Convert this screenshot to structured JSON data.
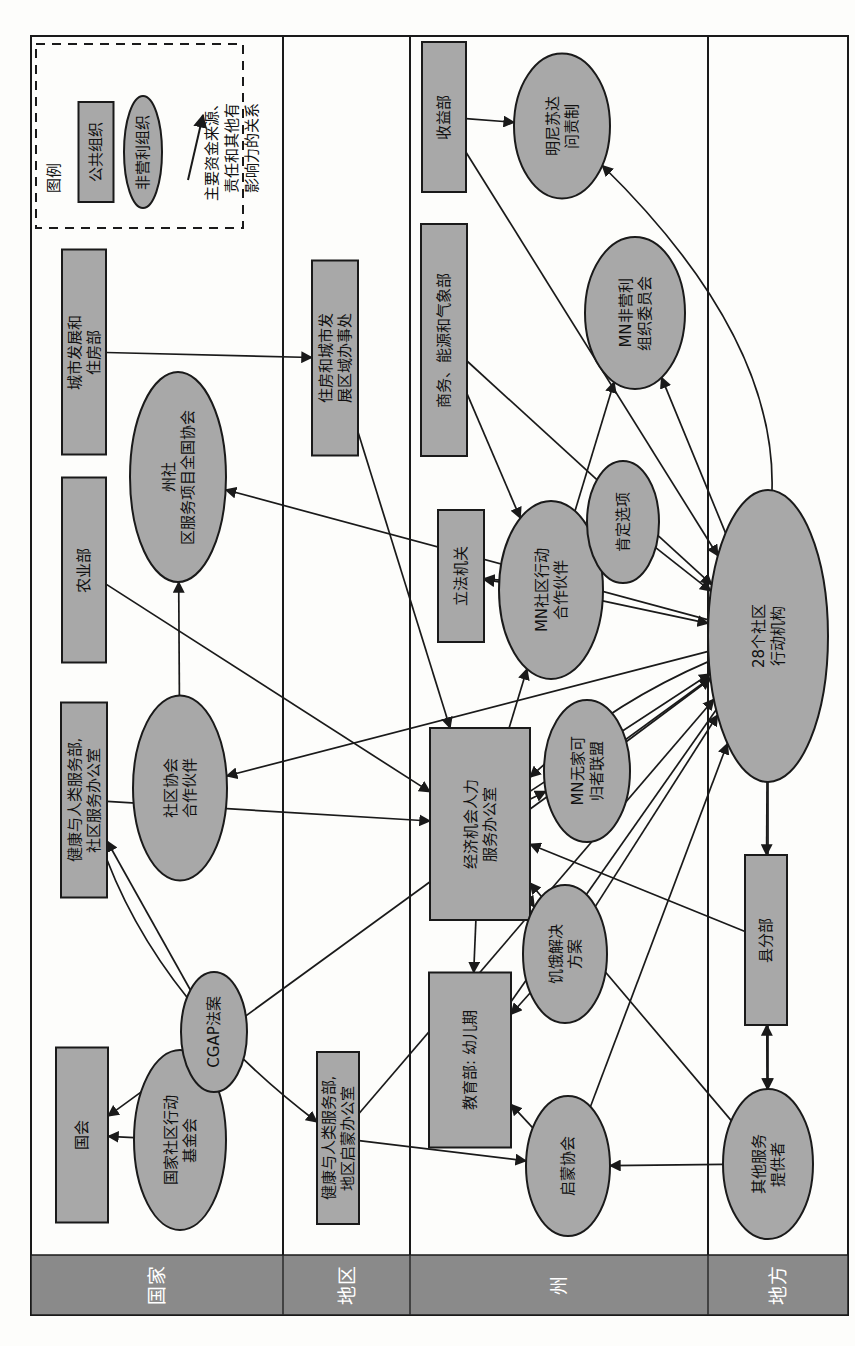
{
  "diagram": {
    "type": "organizational-relationship-network",
    "orientation": "rotated-90-counterclockwise",
    "page_w": 855,
    "page_h": 1346,
    "colors": {
      "node_fill": "#a8a8a8",
      "node_stroke": "#1a1a1a",
      "band_fill": "#8a8a8a",
      "band_text": "#ffffff",
      "edge": "#1a1a1a",
      "frame": "#1a1a1a",
      "background": "#fdfdfb"
    },
    "legend": {
      "title": "图例",
      "items": [
        {
          "id": "leg-public",
          "shape": "rect",
          "label": "公共组织"
        },
        {
          "id": "leg-nonprofit",
          "shape": "ellipse",
          "label": "非营利组织"
        },
        {
          "id": "leg-arrow",
          "shape": "arrow",
          "label": "主要资金来源、\n责任和其他有\n影响力的关系"
        }
      ],
      "arrow_label_lines": [
        "主要资金来源、",
        "责任和其他有",
        "影响力的关系"
      ]
    },
    "levels": [
      {
        "id": "level-national",
        "label": "国家",
        "x0": 31,
        "x1": 283
      },
      {
        "id": "level-regional",
        "label": "地区",
        "x0": 283,
        "x1": 410
      },
      {
        "id": "level-state",
        "label": "州",
        "x0": 410,
        "x1": 708
      },
      {
        "id": "level-local",
        "label": "地方",
        "x0": 708,
        "x1": 848
      }
    ],
    "band": {
      "y0": 1255,
      "y1": 1315
    },
    "nodes": [
      {
        "id": "hud",
        "shape": "rect",
        "level": "国家",
        "cx": 84,
        "cy": 352,
        "w": 44,
        "h": 205,
        "lines": [
          "城市发展和",
          "住房部"
        ]
      },
      {
        "id": "agriculture",
        "shape": "rect",
        "level": "国家",
        "cx": 84,
        "cy": 570,
        "w": 44,
        "h": 185,
        "lines": [
          "农业部"
        ]
      },
      {
        "id": "hhs-ocs",
        "shape": "rect",
        "level": "国家",
        "cx": 84,
        "cy": 800,
        "w": 46,
        "h": 195,
        "lines": [
          "健康与人类服务部,",
          "社区服务办公室"
        ]
      },
      {
        "id": "congress",
        "shape": "rect",
        "level": "国家",
        "cx": 82,
        "cy": 1135,
        "w": 52,
        "h": 175,
        "lines": [
          "国会"
        ]
      },
      {
        "id": "nascsp",
        "shape": "ellipse",
        "level": "国家",
        "cx": 178,
        "cy": 477,
        "w": 96,
        "h": 210,
        "lines": [
          "州社",
          "区服务项目全国协会"
        ]
      },
      {
        "id": "cap-partner",
        "shape": "ellipse",
        "level": "国家",
        "cx": 180,
        "cy": 788,
        "w": 94,
        "h": 185,
        "lines": [
          "社区协会",
          "合作伙伴"
        ]
      },
      {
        "id": "ncaf",
        "shape": "ellipse",
        "level": "国家",
        "cx": 180,
        "cy": 1140,
        "w": 92,
        "h": 180,
        "lines": [
          "国家社区行动",
          "基金会"
        ]
      },
      {
        "id": "cgap-act",
        "shape": "ellipse",
        "level": "国家",
        "cx": 214,
        "cy": 1032,
        "w": 66,
        "h": 120,
        "lines": [
          "CGAP法案"
        ]
      },
      {
        "id": "hud-regional",
        "shape": "rect",
        "level": "地区",
        "cx": 335,
        "cy": 358,
        "w": 46,
        "h": 195,
        "lines": [
          "住房和城市发",
          "展区域办事处"
        ]
      },
      {
        "id": "hhs-headstart",
        "shape": "rect",
        "level": "地区",
        "cx": 338,
        "cy": 1138,
        "w": 42,
        "h": 172,
        "lines": [
          "健康与人类服务部,",
          "地区启蒙办公室"
        ]
      },
      {
        "id": "revenue-dept",
        "shape": "rect",
        "level": "州",
        "cx": 444,
        "cy": 117,
        "w": 44,
        "h": 150,
        "lines": [
          "收益部"
        ]
      },
      {
        "id": "commerce-dept",
        "shape": "rect",
        "level": "州",
        "cx": 444,
        "cy": 340,
        "w": 46,
        "h": 232,
        "lines": [
          "商务、能源和气象部"
        ]
      },
      {
        "id": "legislature",
        "shape": "rect",
        "level": "州",
        "cx": 461,
        "cy": 576,
        "w": 46,
        "h": 132,
        "lines": [
          "立法机关"
        ]
      },
      {
        "id": "oeo-hs",
        "shape": "rect",
        "level": "州",
        "cx": 480,
        "cy": 824,
        "w": 100,
        "h": 192,
        "lines": [
          "经济机会人力",
          "服务办公室"
        ]
      },
      {
        "id": "education-ec",
        "shape": "rect",
        "level": "州",
        "cx": 470,
        "cy": 1060,
        "w": 82,
        "h": 175,
        "lines": [
          "教育部: 幼儿期"
        ]
      },
      {
        "id": "mn-accountability",
        "shape": "ellipse",
        "level": "州",
        "cx": 562,
        "cy": 126,
        "w": 96,
        "h": 145,
        "lines": [
          "明尼苏达",
          "问责制"
        ]
      },
      {
        "id": "mn-nonprofits",
        "shape": "ellipse",
        "level": "州",
        "cx": 635,
        "cy": 313,
        "w": 100,
        "h": 152,
        "lines": [
          "MN非营利",
          "组织委员会"
        ]
      },
      {
        "id": "mncap",
        "shape": "ellipse",
        "level": "州",
        "cx": 551,
        "cy": 590,
        "w": 104,
        "h": 178,
        "lines": [
          "MN社区行动",
          "合作伙伴"
        ]
      },
      {
        "id": "affirm-options",
        "shape": "ellipse",
        "level": "州",
        "cx": 623,
        "cy": 522,
        "w": 72,
        "h": 122,
        "lines": [
          "肯定选项"
        ]
      },
      {
        "id": "mn-homeless",
        "shape": "ellipse",
        "level": "州",
        "cx": 587,
        "cy": 771,
        "w": 86,
        "h": 142,
        "lines": [
          "MN无家可",
          "归者联盟"
        ]
      },
      {
        "id": "hunger-sol",
        "shape": "ellipse",
        "level": "州",
        "cx": 565,
        "cy": 954,
        "w": 84,
        "h": 138,
        "lines": [
          "饥饿解决",
          "方案"
        ]
      },
      {
        "id": "headstart-assoc",
        "shape": "ellipse",
        "level": "州",
        "cx": 568,
        "cy": 1166,
        "w": 84,
        "h": 140,
        "lines": [
          "启蒙协会"
        ]
      },
      {
        "id": "caa28",
        "shape": "ellipse",
        "level": "地方",
        "cx": 768,
        "cy": 636,
        "w": 120,
        "h": 292,
        "lines": [
          "28个社区",
          "行动机构"
        ]
      },
      {
        "id": "county-div",
        "shape": "rect",
        "level": "地方",
        "cx": 766,
        "cy": 940,
        "w": 42,
        "h": 170,
        "lines": [
          "县分部"
        ]
      },
      {
        "id": "other-providers",
        "shape": "ellipse",
        "level": "地方",
        "cx": 768,
        "cy": 1164,
        "w": 90,
        "h": 150,
        "lines": [
          "其他服务",
          "提供者"
        ]
      }
    ],
    "edges": [
      {
        "from": "revenue-dept",
        "to": "mn-accountability",
        "arrow": "end",
        "curve": 0
      },
      {
        "from": "caa28",
        "to": "mn-accountability",
        "arrow": "end",
        "curve": 120
      },
      {
        "from": "revenue-dept",
        "to": "caa28",
        "arrow": "end",
        "curve": 0
      },
      {
        "from": "commerce-dept",
        "to": "caa28",
        "arrow": "end",
        "curve": 0
      },
      {
        "from": "commerce-dept",
        "to": "mncap",
        "arrow": "end",
        "curve": 0
      },
      {
        "from": "caa28",
        "to": "mn-nonprofits",
        "arrow": "end",
        "curve": 0
      },
      {
        "from": "mncap",
        "to": "mn-nonprofits",
        "arrow": "end",
        "curve": 0
      },
      {
        "from": "mncap",
        "to": "legislature",
        "arrow": "both",
        "curve": 0
      },
      {
        "from": "mncap",
        "to": "caa28",
        "arrow": "both",
        "curve": 0
      },
      {
        "from": "affirm-options",
        "to": "caa28",
        "arrow": "both",
        "curve": 0
      },
      {
        "from": "affirm-options",
        "to": "legislature",
        "arrow": "end",
        "curve": -40
      },
      {
        "from": "hud",
        "to": "hud-regional",
        "arrow": "end",
        "curve": 0
      },
      {
        "from": "hud-regional",
        "to": "oeo-hs",
        "arrow": "end",
        "curve": 0
      },
      {
        "from": "hhs-ocs",
        "to": "oeo-hs",
        "arrow": "end",
        "curve": 0
      },
      {
        "from": "hhs-ocs",
        "to": "hhs-headstart",
        "arrow": "end",
        "curve": 60
      },
      {
        "from": "agriculture",
        "to": "oeo-hs",
        "arrow": "end",
        "curve": 0
      },
      {
        "from": "oeo-hs",
        "to": "caa28",
        "arrow": "both",
        "curve": 0
      },
      {
        "from": "oeo-hs",
        "to": "mncap",
        "arrow": "end",
        "curve": 0
      },
      {
        "from": "oeo-hs",
        "to": "mn-homeless",
        "arrow": "both",
        "curve": 0
      },
      {
        "from": "oeo-hs",
        "to": "hunger-sol",
        "arrow": "both",
        "curve": 0
      },
      {
        "from": "oeo-hs",
        "to": "education-ec",
        "arrow": "both",
        "curve": 0
      },
      {
        "from": "mn-homeless",
        "to": "caa28",
        "arrow": "both",
        "curve": 0
      },
      {
        "from": "hunger-sol",
        "to": "caa28",
        "arrow": "both",
        "curve": 0
      },
      {
        "from": "education-ec",
        "to": "caa28",
        "arrow": "start",
        "curve": 0
      },
      {
        "from": "headstart-assoc",
        "to": "education-ec",
        "arrow": "end",
        "curve": 0
      },
      {
        "from": "headstart-assoc",
        "to": "caa28",
        "arrow": "both",
        "curve": 0
      },
      {
        "from": "hhs-headstart",
        "to": "headstart-assoc",
        "arrow": "end",
        "curve": 0
      },
      {
        "from": "hhs-headstart",
        "to": "caa28",
        "arrow": "end",
        "curve": 0
      },
      {
        "from": "caa28",
        "to": "county-div",
        "arrow": "both",
        "curve": 0
      },
      {
        "from": "caa28",
        "to": "other-providers",
        "arrow": "both",
        "curve": 0
      },
      {
        "from": "county-div",
        "to": "other-providers",
        "arrow": "both",
        "curve": 0
      },
      {
        "from": "other-providers",
        "to": "headstart-assoc",
        "arrow": "end",
        "curve": 0
      },
      {
        "from": "caa28",
        "to": "nascsp",
        "arrow": "end",
        "curve": 0
      },
      {
        "from": "caa28",
        "to": "cap-partner",
        "arrow": "end",
        "curve": 0
      },
      {
        "from": "cap-partner",
        "to": "nascsp",
        "arrow": "end",
        "curve": 0
      },
      {
        "from": "ncaf",
        "to": "congress",
        "arrow": "end",
        "curve": 0
      },
      {
        "from": "cgap-act",
        "to": "hhs-ocs",
        "arrow": "end",
        "curve": 0
      },
      {
        "from": "caa28",
        "to": "congress",
        "arrow": "end",
        "curve": 0
      },
      {
        "from": "caa28",
        "to": "oeo-hs",
        "arrow": "end",
        "curve": 30
      },
      {
        "from": "county-div",
        "to": "oeo-hs",
        "arrow": "end",
        "curve": 0
      },
      {
        "from": "other-providers",
        "to": "oeo-hs",
        "arrow": "end",
        "curve": 0
      },
      {
        "from": "hunger-sol",
        "to": "education-ec",
        "arrow": "end",
        "curve": 0
      },
      {
        "from": "other-providers",
        "to": "county-div",
        "arrow": "both",
        "curve": 0
      }
    ]
  }
}
